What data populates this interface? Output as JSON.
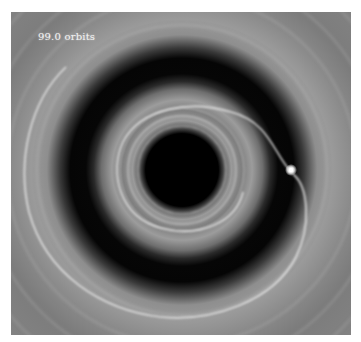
{
  "simulation": {
    "time_label": "99.0 orbits",
    "description": "Protoplanetary disk simulation showing a planet-carved gap and spiral wakes"
  },
  "colors": {
    "background": "#ffffff",
    "disk_gray": "#8a8a8a",
    "gap_dark": "#050505",
    "label_text": "#f2f2f2"
  }
}
